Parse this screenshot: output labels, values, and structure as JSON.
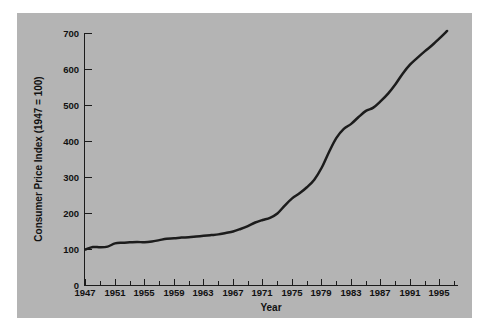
{
  "figure": {
    "background_color": "#ffffff",
    "plate_color": "#b4b4b4",
    "line_color": "#1c1c1c",
    "axis_color": "#1b1b1b"
  },
  "chart_data": {
    "type": "line",
    "title": "",
    "xlabel": "Year",
    "ylabel": "Consumer Price Index (1947 = 100)",
    "xlim": [
      1947,
      1997
    ],
    "ylim": [
      0,
      700
    ],
    "grid": false,
    "legend": "none",
    "y_ticks": [
      0,
      100,
      200,
      300,
      400,
      500,
      600,
      700
    ],
    "y_tick_labels": [
      "0",
      "100",
      "200",
      "300",
      "400",
      "500",
      "600",
      "700"
    ],
    "x_ticks": [
      1947,
      1951,
      1955,
      1959,
      1963,
      1967,
      1971,
      1975,
      1979,
      1983,
      1987,
      1991,
      1995
    ],
    "x_tick_labels": [
      "1947",
      "1951",
      "1955",
      "1959",
      "1963",
      "1967",
      "1971",
      "1975",
      "1979",
      "1983",
      "1987",
      "1991",
      "1995"
    ],
    "x_minor_ticks": [
      1949,
      1953,
      1957,
      1961,
      1965,
      1969,
      1973,
      1977,
      1981,
      1985,
      1989,
      1993,
      1997
    ],
    "series": [
      {
        "name": "Consumer Price Index",
        "x": [
          1947,
          1948,
          1949,
          1950,
          1951,
          1952,
          1953,
          1954,
          1955,
          1956,
          1957,
          1958,
          1959,
          1960,
          1961,
          1962,
          1963,
          1964,
          1965,
          1966,
          1967,
          1968,
          1969,
          1970,
          1971,
          1972,
          1973,
          1974,
          1975,
          1976,
          1977,
          1978,
          1979,
          1980,
          1981,
          1982,
          1983,
          1984,
          1985,
          1986,
          1987,
          1988,
          1989,
          1990,
          1991,
          1992,
          1993,
          1994,
          1995,
          1996
        ],
        "values": [
          100,
          107,
          106,
          108,
          117,
          119,
          120,
          121,
          120,
          122,
          126,
          130,
          131,
          133,
          134,
          136,
          138,
          140,
          142,
          146,
          150,
          157,
          165,
          175,
          182,
          188,
          200,
          222,
          242,
          256,
          273,
          294,
          327,
          371,
          410,
          435,
          449,
          468,
          485,
          494,
          512,
          533,
          559,
          589,
          614,
          633,
          651,
          668,
          687,
          707
        ],
        "note": "Values read from the plotted curve; 1947 indexed to 100"
      }
    ],
    "annotations": []
  },
  "axis_titles": {
    "y": "Consumer Price Index (1947 = 100)",
    "x": "Year"
  }
}
